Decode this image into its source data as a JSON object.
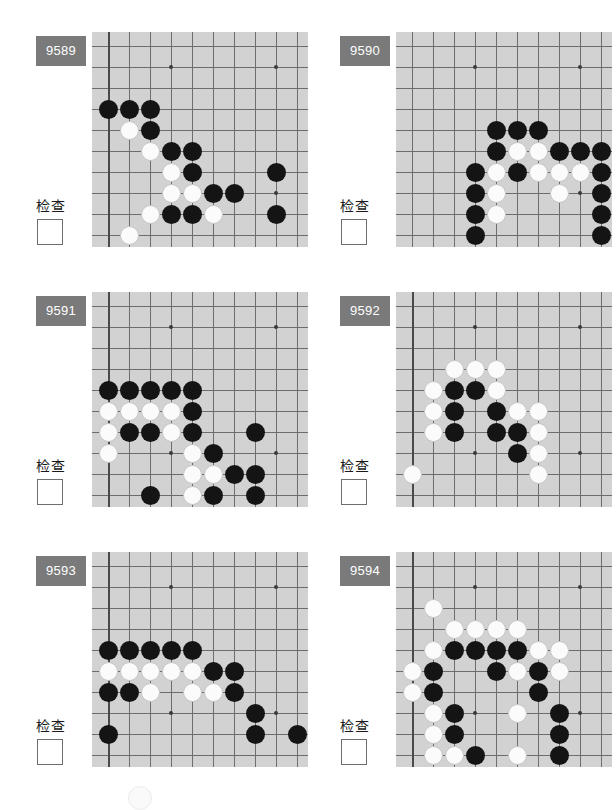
{
  "page": {
    "columns": 2,
    "rows": 3,
    "check_label": "检查",
    "badge_color": "#7a7a7a",
    "board_color": "#d2d2d2",
    "line_color": "#6d6d6d",
    "black_color": "#141414",
    "white_color": "#fbfbfb"
  },
  "board_geometry": {
    "cols": 10,
    "rows": 10,
    "cell": 21,
    "origin_x": 16,
    "origin_y": 14,
    "star_points": [
      [
        3,
        1
      ],
      [
        8,
        1
      ],
      [
        3,
        7
      ],
      [
        8,
        7
      ]
    ]
  },
  "panels": [
    {
      "id": "9589",
      "check_label": "检查",
      "checked": false,
      "edges": {
        "left": true,
        "bottom": true,
        "right": false,
        "top": false
      },
      "stones": [
        {
          "c": 0,
          "r": 3,
          "color": "black"
        },
        {
          "c": 1,
          "r": 3,
          "color": "black"
        },
        {
          "c": 2,
          "r": 3,
          "color": "black"
        },
        {
          "c": 1,
          "r": 4,
          "color": "white"
        },
        {
          "c": 2,
          "r": 4,
          "color": "black"
        },
        {
          "c": 2,
          "r": 5,
          "color": "white"
        },
        {
          "c": 3,
          "r": 5,
          "color": "black"
        },
        {
          "c": 4,
          "r": 5,
          "color": "black"
        },
        {
          "c": 3,
          "r": 6,
          "color": "white"
        },
        {
          "c": 4,
          "r": 6,
          "color": "black"
        },
        {
          "c": 8,
          "r": 6,
          "color": "black"
        },
        {
          "c": 3,
          "r": 7,
          "color": "white"
        },
        {
          "c": 4,
          "r": 7,
          "color": "white"
        },
        {
          "c": 5,
          "r": 7,
          "color": "black"
        },
        {
          "c": 6,
          "r": 7,
          "color": "black"
        },
        {
          "c": 2,
          "r": 8,
          "color": "white"
        },
        {
          "c": 3,
          "r": 8,
          "color": "black"
        },
        {
          "c": 4,
          "r": 8,
          "color": "black"
        },
        {
          "c": 5,
          "r": 8,
          "color": "white"
        },
        {
          "c": 8,
          "r": 8,
          "color": "black"
        },
        {
          "c": 1,
          "r": 9,
          "color": "white"
        }
      ]
    },
    {
      "id": "9590",
      "check_label": "检查",
      "checked": false,
      "edges": {
        "left": false,
        "bottom": true,
        "right": true,
        "top": false
      },
      "stones": [
        {
          "c": 4,
          "r": 4,
          "color": "black"
        },
        {
          "c": 5,
          "r": 4,
          "color": "black"
        },
        {
          "c": 6,
          "r": 4,
          "color": "black"
        },
        {
          "c": 4,
          "r": 5,
          "color": "black"
        },
        {
          "c": 5,
          "r": 5,
          "color": "white"
        },
        {
          "c": 6,
          "r": 5,
          "color": "white"
        },
        {
          "c": 7,
          "r": 5,
          "color": "black"
        },
        {
          "c": 8,
          "r": 5,
          "color": "black"
        },
        {
          "c": 9,
          "r": 5,
          "color": "black"
        },
        {
          "c": 3,
          "r": 6,
          "color": "black"
        },
        {
          "c": 4,
          "r": 6,
          "color": "white"
        },
        {
          "c": 5,
          "r": 6,
          "color": "black"
        },
        {
          "c": 6,
          "r": 6,
          "color": "white"
        },
        {
          "c": 7,
          "r": 6,
          "color": "white"
        },
        {
          "c": 8,
          "r": 6,
          "color": "white"
        },
        {
          "c": 9,
          "r": 6,
          "color": "black"
        },
        {
          "c": 3,
          "r": 7,
          "color": "black"
        },
        {
          "c": 4,
          "r": 7,
          "color": "white"
        },
        {
          "c": 7,
          "r": 7,
          "color": "white"
        },
        {
          "c": 9,
          "r": 7,
          "color": "black"
        },
        {
          "c": 3,
          "r": 8,
          "color": "black"
        },
        {
          "c": 4,
          "r": 8,
          "color": "white"
        },
        {
          "c": 9,
          "r": 8,
          "color": "black"
        },
        {
          "c": 3,
          "r": 9,
          "color": "black"
        },
        {
          "c": 9,
          "r": 9,
          "color": "black"
        }
      ]
    },
    {
      "id": "9591",
      "check_label": "检查",
      "checked": false,
      "edges": {
        "left": true,
        "bottom": true,
        "right": false,
        "top": false
      },
      "stones": [
        {
          "c": 0,
          "r": 4,
          "color": "black"
        },
        {
          "c": 1,
          "r": 4,
          "color": "black"
        },
        {
          "c": 2,
          "r": 4,
          "color": "black"
        },
        {
          "c": 3,
          "r": 4,
          "color": "black"
        },
        {
          "c": 4,
          "r": 4,
          "color": "black"
        },
        {
          "c": 0,
          "r": 5,
          "color": "white"
        },
        {
          "c": 1,
          "r": 5,
          "color": "white"
        },
        {
          "c": 2,
          "r": 5,
          "color": "white"
        },
        {
          "c": 3,
          "r": 5,
          "color": "white"
        },
        {
          "c": 4,
          "r": 5,
          "color": "black"
        },
        {
          "c": 0,
          "r": 6,
          "color": "white"
        },
        {
          "c": 1,
          "r": 6,
          "color": "black"
        },
        {
          "c": 2,
          "r": 6,
          "color": "black"
        },
        {
          "c": 3,
          "r": 6,
          "color": "white"
        },
        {
          "c": 4,
          "r": 6,
          "color": "black"
        },
        {
          "c": 7,
          "r": 6,
          "color": "black"
        },
        {
          "c": 0,
          "r": 7,
          "color": "white"
        },
        {
          "c": 4,
          "r": 7,
          "color": "white"
        },
        {
          "c": 5,
          "r": 7,
          "color": "black"
        },
        {
          "c": 4,
          "r": 8,
          "color": "white"
        },
        {
          "c": 5,
          "r": 8,
          "color": "white"
        },
        {
          "c": 6,
          "r": 8,
          "color": "black"
        },
        {
          "c": 7,
          "r": 8,
          "color": "black"
        },
        {
          "c": 2,
          "r": 9,
          "color": "black"
        },
        {
          "c": 4,
          "r": 9,
          "color": "white"
        },
        {
          "c": 5,
          "r": 9,
          "color": "black"
        },
        {
          "c": 7,
          "r": 9,
          "color": "black"
        }
      ]
    },
    {
      "id": "9592",
      "check_label": "检查",
      "checked": false,
      "edges": {
        "left": true,
        "bottom": true,
        "right": false,
        "top": false
      },
      "stones": [
        {
          "c": 2,
          "r": 3,
          "color": "white"
        },
        {
          "c": 3,
          "r": 3,
          "color": "white"
        },
        {
          "c": 4,
          "r": 3,
          "color": "white"
        },
        {
          "c": 1,
          "r": 4,
          "color": "white"
        },
        {
          "c": 2,
          "r": 4,
          "color": "black"
        },
        {
          "c": 3,
          "r": 4,
          "color": "black"
        },
        {
          "c": 4,
          "r": 4,
          "color": "white"
        },
        {
          "c": 1,
          "r": 5,
          "color": "white"
        },
        {
          "c": 2,
          "r": 5,
          "color": "black"
        },
        {
          "c": 4,
          "r": 5,
          "color": "black"
        },
        {
          "c": 5,
          "r": 5,
          "color": "white"
        },
        {
          "c": 6,
          "r": 5,
          "color": "white"
        },
        {
          "c": 1,
          "r": 6,
          "color": "white"
        },
        {
          "c": 2,
          "r": 6,
          "color": "black"
        },
        {
          "c": 4,
          "r": 6,
          "color": "black"
        },
        {
          "c": 5,
          "r": 6,
          "color": "black"
        },
        {
          "c": 6,
          "r": 6,
          "color": "white"
        },
        {
          "c": 5,
          "r": 7,
          "color": "black"
        },
        {
          "c": 6,
          "r": 7,
          "color": "white"
        },
        {
          "c": 0,
          "r": 8,
          "color": "white"
        },
        {
          "c": 6,
          "r": 8,
          "color": "white"
        }
      ]
    },
    {
      "id": "9593",
      "check_label": "检查",
      "checked": false,
      "edges": {
        "left": true,
        "bottom": true,
        "right": false,
        "top": false
      },
      "stones": [
        {
          "c": 0,
          "r": 4,
          "color": "black"
        },
        {
          "c": 1,
          "r": 4,
          "color": "black"
        },
        {
          "c": 2,
          "r": 4,
          "color": "black"
        },
        {
          "c": 3,
          "r": 4,
          "color": "black"
        },
        {
          "c": 4,
          "r": 4,
          "color": "black"
        },
        {
          "c": 0,
          "r": 5,
          "color": "white"
        },
        {
          "c": 1,
          "r": 5,
          "color": "white"
        },
        {
          "c": 2,
          "r": 5,
          "color": "white"
        },
        {
          "c": 3,
          "r": 5,
          "color": "white"
        },
        {
          "c": 4,
          "r": 5,
          "color": "white"
        },
        {
          "c": 5,
          "r": 5,
          "color": "black"
        },
        {
          "c": 6,
          "r": 5,
          "color": "black"
        },
        {
          "c": 0,
          "r": 6,
          "color": "black"
        },
        {
          "c": 1,
          "r": 6,
          "color": "black"
        },
        {
          "c": 2,
          "r": 6,
          "color": "white"
        },
        {
          "c": 4,
          "r": 6,
          "color": "white"
        },
        {
          "c": 5,
          "r": 6,
          "color": "white"
        },
        {
          "c": 6,
          "r": 6,
          "color": "black"
        },
        {
          "c": 7,
          "r": 7,
          "color": "black"
        },
        {
          "c": 0,
          "r": 8,
          "color": "black"
        },
        {
          "c": 7,
          "r": 8,
          "color": "black"
        },
        {
          "c": 9,
          "r": 8,
          "color": "black"
        }
      ]
    },
    {
      "id": "9594",
      "check_label": "检查",
      "checked": false,
      "edges": {
        "left": true,
        "bottom": true,
        "right": false,
        "top": false
      },
      "stones": [
        {
          "c": 1,
          "r": 2,
          "color": "white"
        },
        {
          "c": 2,
          "r": 3,
          "color": "white"
        },
        {
          "c": 3,
          "r": 3,
          "color": "white"
        },
        {
          "c": 4,
          "r": 3,
          "color": "white"
        },
        {
          "c": 5,
          "r": 3,
          "color": "white"
        },
        {
          "c": 1,
          "r": 4,
          "color": "white"
        },
        {
          "c": 2,
          "r": 4,
          "color": "black"
        },
        {
          "c": 3,
          "r": 4,
          "color": "black"
        },
        {
          "c": 4,
          "r": 4,
          "color": "black"
        },
        {
          "c": 5,
          "r": 4,
          "color": "black"
        },
        {
          "c": 6,
          "r": 4,
          "color": "white"
        },
        {
          "c": 7,
          "r": 4,
          "color": "white"
        },
        {
          "c": 0,
          "r": 5,
          "color": "white"
        },
        {
          "c": 1,
          "r": 5,
          "color": "black"
        },
        {
          "c": 4,
          "r": 5,
          "color": "black"
        },
        {
          "c": 5,
          "r": 5,
          "color": "white"
        },
        {
          "c": 6,
          "r": 5,
          "color": "black"
        },
        {
          "c": 7,
          "r": 5,
          "color": "white"
        },
        {
          "c": 0,
          "r": 6,
          "color": "white"
        },
        {
          "c": 1,
          "r": 6,
          "color": "black"
        },
        {
          "c": 6,
          "r": 6,
          "color": "black"
        },
        {
          "c": 1,
          "r": 7,
          "color": "white"
        },
        {
          "c": 2,
          "r": 7,
          "color": "black"
        },
        {
          "c": 5,
          "r": 7,
          "color": "white"
        },
        {
          "c": 7,
          "r": 7,
          "color": "black"
        },
        {
          "c": 1,
          "r": 8,
          "color": "white"
        },
        {
          "c": 2,
          "r": 8,
          "color": "black"
        },
        {
          "c": 7,
          "r": 8,
          "color": "black"
        },
        {
          "c": 1,
          "r": 9,
          "color": "white"
        },
        {
          "c": 2,
          "r": 9,
          "color": "white"
        },
        {
          "c": 3,
          "r": 9,
          "color": "black"
        },
        {
          "c": 5,
          "r": 9,
          "color": "white"
        },
        {
          "c": 7,
          "r": 9,
          "color": "black"
        },
        {
          "c": 2,
          "r": 10,
          "color": "white"
        },
        {
          "c": 3,
          "r": 10,
          "color": "white"
        },
        {
          "c": 4,
          "r": 10,
          "color": "black"
        },
        {
          "c": 5,
          "r": 10,
          "color": "black"
        },
        {
          "c": 6,
          "r": 10,
          "color": "black"
        },
        {
          "c": 7,
          "r": 10,
          "color": "white"
        }
      ]
    }
  ]
}
